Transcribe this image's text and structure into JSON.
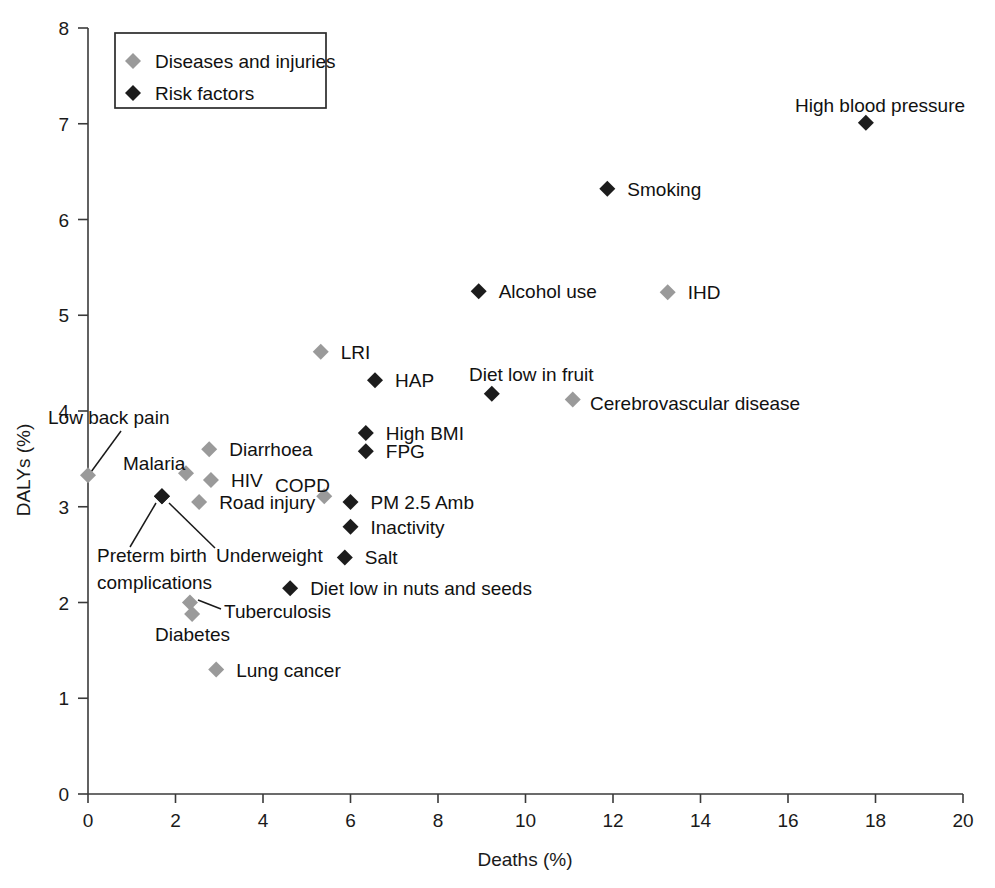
{
  "chart_data": {
    "type": "scatter",
    "title": "",
    "xlabel": "Deaths (%)",
    "ylabel": "DALYs (%)",
    "xlim": [
      0,
      20
    ],
    "ylim": [
      0,
      8
    ],
    "xticks": [
      "0",
      "2",
      "4",
      "6",
      "8",
      "10",
      "12",
      "14",
      "16",
      "18",
      "20"
    ],
    "yticks": [
      "0",
      "1",
      "2",
      "3",
      "4",
      "5",
      "6",
      "7",
      "8"
    ],
    "grid": false,
    "legend_position": "top-left",
    "colors": {
      "diseases": "#9a9a9a",
      "risk_factors": "#1c1c1c",
      "axis": "#3a3a3a",
      "text": "#111111",
      "background": "#ffffff"
    },
    "legend": [
      {
        "label": "Diseases and injuries",
        "series": "diseases",
        "marker": "diamond-gray"
      },
      {
        "label": "Risk factors",
        "series": "risk_factors",
        "marker": "diamond-black"
      }
    ],
    "series": [
      {
        "name": "Diseases and injuries",
        "color": "#9a9a9a",
        "points": [
          {
            "label": "IHD",
            "x": 13.25,
            "y": 5.24,
            "label_pos": "right"
          },
          {
            "label": "LRI",
            "x": 5.32,
            "y": 4.62,
            "label_pos": "right"
          },
          {
            "label": "Cerebrovascular disease",
            "x": 11.08,
            "y": 4.12,
            "label_pos": "right"
          },
          {
            "label": "Diarrhoea",
            "x": 2.77,
            "y": 3.6,
            "label_pos": "right"
          },
          {
            "label": "Low back pain",
            "x": 0.0,
            "y": 3.33,
            "label_pos": "leader-up-right"
          },
          {
            "label": "Malaria",
            "x": 2.24,
            "y": 3.35,
            "label_pos": "above-left"
          },
          {
            "label": "HIV",
            "x": 2.81,
            "y": 3.28,
            "label_pos": "right"
          },
          {
            "label": "COPD",
            "x": 5.4,
            "y": 3.11,
            "label_pos": "above-left"
          },
          {
            "label": "Road injury",
            "x": 2.54,
            "y": 3.05,
            "label_pos": "right"
          },
          {
            "label": "Tuberculosis",
            "x": 2.33,
            "y": 2.0,
            "label_pos": "leader-right"
          },
          {
            "label": "Diabetes",
            "x": 2.38,
            "y": 1.88,
            "label_pos": "below-left"
          },
          {
            "label": "Lung cancer",
            "x": 2.93,
            "y": 1.3,
            "label_pos": "right"
          }
        ]
      },
      {
        "name": "Risk factors",
        "color": "#1c1c1c",
        "points": [
          {
            "label": "High blood pressure",
            "x": 17.78,
            "y": 7.01,
            "label_pos": "above"
          },
          {
            "label": "Smoking",
            "x": 11.87,
            "y": 6.32,
            "label_pos": "right"
          },
          {
            "label": "Alcohol use",
            "x": 8.93,
            "y": 5.25,
            "label_pos": "right"
          },
          {
            "label": "HAP",
            "x": 6.56,
            "y": 4.32,
            "label_pos": "right"
          },
          {
            "label": "Diet low in fruit",
            "x": 9.23,
            "y": 4.18,
            "label_pos": "above"
          },
          {
            "label": "High BMI",
            "x": 6.35,
            "y": 3.77,
            "label_pos": "right"
          },
          {
            "label": "FPG",
            "x": 6.35,
            "y": 3.58,
            "label_pos": "right"
          },
          {
            "label": "Preterm birth complications",
            "x": 1.69,
            "y": 3.11,
            "label_pos": "leader-down-left"
          },
          {
            "label": "Underweight",
            "x": 1.69,
            "y": 3.11,
            "label_pos": "leader-down-right"
          },
          {
            "label": "PM 2.5 Amb",
            "x": 6.0,
            "y": 3.05,
            "label_pos": "right"
          },
          {
            "label": "Inactivity",
            "x": 6.0,
            "y": 2.79,
            "label_pos": "right"
          },
          {
            "label": "Salt",
            "x": 5.87,
            "y": 2.47,
            "label_pos": "right"
          },
          {
            "label": "Diet low in nuts and seeds",
            "x": 4.62,
            "y": 2.15,
            "label_pos": "right"
          }
        ]
      }
    ]
  }
}
